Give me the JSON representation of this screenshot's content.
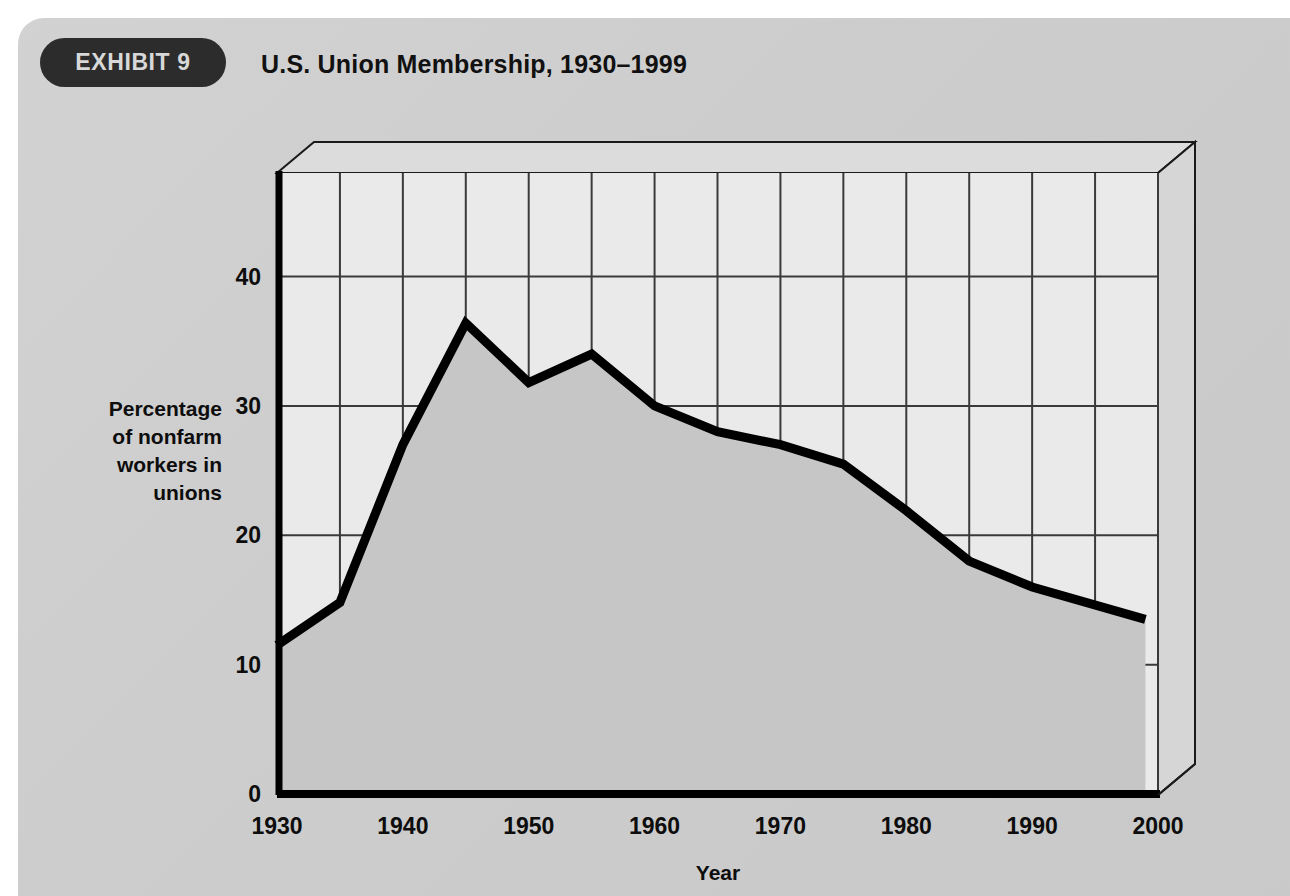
{
  "header": {
    "badge_label": "EXHIBIT 9",
    "title": "U.S. Union Membership, 1930–1999"
  },
  "colors": {
    "page_background": "#cfcfcf",
    "badge_background": "#2c2c2c",
    "badge_text": "#d8d8d8",
    "plot_background": "#e9e9e9",
    "area_fill": "#c6c6c6",
    "line": "#000000",
    "gridline": "#3a3a3a",
    "axis": "#000000",
    "wall_face": "#dedede"
  },
  "chart_data": {
    "type": "area",
    "title": "U.S. Union Membership, 1930–1999",
    "xlabel": "Year",
    "ylabel": "Percentage of nonfarm workers in unions",
    "ylabel_lines": [
      "Percentage",
      "of nonfarm",
      "workers in",
      "unions"
    ],
    "x": [
      1930,
      1935,
      1940,
      1945,
      1950,
      1955,
      1960,
      1965,
      1970,
      1975,
      1980,
      1985,
      1990,
      1999
    ],
    "values": [
      11.5,
      14.8,
      27.0,
      36.4,
      31.8,
      34.0,
      30.0,
      28.0,
      27.0,
      25.5,
      21.9,
      18.0,
      16.0,
      13.5
    ],
    "series": [
      {
        "name": "Percentage of nonfarm workers in unions",
        "values": [
          11.5,
          14.8,
          27.0,
          36.4,
          31.8,
          34.0,
          30.0,
          28.0,
          27.0,
          25.5,
          21.9,
          18.0,
          16.0,
          13.5
        ]
      }
    ],
    "xlim": [
      1930,
      2000
    ],
    "ylim": [
      0,
      48
    ],
    "x_tick_labels": [
      "1930",
      "1940",
      "1950",
      "1960",
      "1970",
      "1980",
      "1990",
      "2000"
    ],
    "x_tick_values": [
      1930,
      1940,
      1950,
      1960,
      1970,
      1980,
      1990,
      2000
    ],
    "x_minor_step": 5,
    "y_tick_labels": [
      "0",
      "10",
      "20",
      "30",
      "40"
    ],
    "y_tick_values": [
      0,
      10,
      20,
      30,
      40
    ],
    "grid": true,
    "legend": "none",
    "style_3d": true
  }
}
